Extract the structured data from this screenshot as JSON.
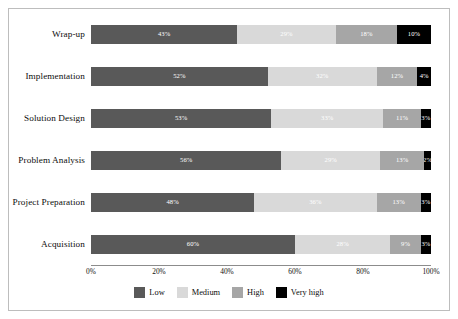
{
  "chart_data": {
    "type": "bar",
    "orientation": "horizontal",
    "stacked": true,
    "stack_mode": "percent",
    "title": "",
    "xlabel": "",
    "ylabel": "",
    "xlim": [
      0,
      100
    ],
    "grid": false,
    "legend_position": "bottom-center",
    "categories": [
      "Wrap-up",
      "Implementation",
      "Solution Design",
      "Problem Analysis",
      "Project Preparation",
      "Acquisition"
    ],
    "tick_labels": [
      "0%",
      "20%",
      "40%",
      "60%",
      "80%",
      "100%"
    ],
    "tick_values": [
      0,
      20,
      40,
      60,
      80,
      100
    ],
    "series": [
      {
        "name": "Low",
        "color": "#595959",
        "values": [
          43,
          52,
          53,
          56,
          48,
          60
        ],
        "labels": [
          "43%",
          "52%",
          "53%",
          "56%",
          "48%",
          "60%"
        ]
      },
      {
        "name": "Medium",
        "color": "#d9d9d9",
        "values": [
          29,
          32,
          33,
          29,
          36,
          28
        ],
        "labels": [
          "29%",
          "32%",
          "33%",
          "29%",
          "36%",
          "28%"
        ]
      },
      {
        "name": "High",
        "color": "#a6a6a6",
        "values": [
          18,
          12,
          11,
          13,
          13,
          9
        ],
        "labels": [
          "18%",
          "12%",
          "11%",
          "13%",
          "13%",
          "9%"
        ]
      },
      {
        "name": "Very high",
        "color": "#000000",
        "values": [
          10,
          4,
          3,
          2,
          3,
          3
        ],
        "labels": [
          "10%",
          "4%",
          "3%",
          "2%",
          "3%",
          "3%"
        ]
      }
    ]
  }
}
